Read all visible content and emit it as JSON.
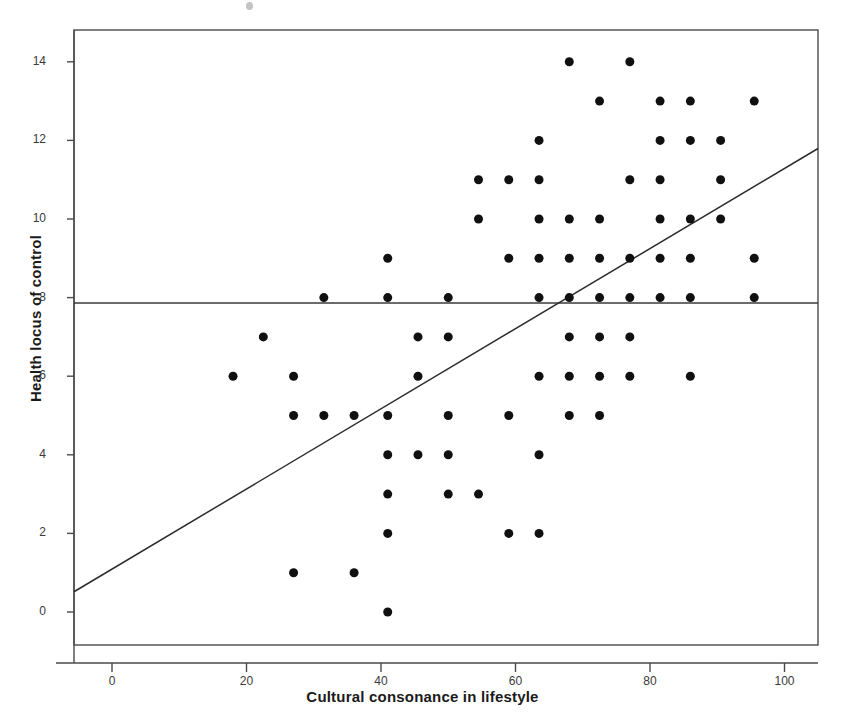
{
  "chart_data": {
    "type": "scatter",
    "title": "",
    "xlabel": "Cultural consonance in lifestyle",
    "ylabel": "Health locus of control",
    "xlim": [
      -6,
      107
    ],
    "ylim": [
      -1.2,
      14.9
    ],
    "xticks": [
      0,
      20,
      40,
      60,
      80,
      100
    ],
    "yticks": [
      0,
      2,
      4,
      6,
      8,
      10,
      12,
      14
    ],
    "xtick_labels": [
      "0",
      "20",
      "40",
      "60",
      "80",
      "100"
    ],
    "ytick_labels": [
      "0",
      "2",
      "4",
      "6",
      "8",
      "10",
      "12",
      "14"
    ],
    "grid": false,
    "legend": null,
    "marker": "filled-circle",
    "marker_color": "#101010",
    "marker_size": 9,
    "points": [
      [
        18,
        6
      ],
      [
        22.5,
        7
      ],
      [
        27,
        6
      ],
      [
        27,
        5
      ],
      [
        27,
        1
      ],
      [
        31.5,
        8
      ],
      [
        31.5,
        5
      ],
      [
        36,
        5
      ],
      [
        36,
        1
      ],
      [
        41,
        9
      ],
      [
        41,
        8
      ],
      [
        41,
        5
      ],
      [
        41,
        4
      ],
      [
        41,
        3
      ],
      [
        41,
        2
      ],
      [
        41,
        0
      ],
      [
        45.5,
        7
      ],
      [
        45.5,
        6
      ],
      [
        45.5,
        4
      ],
      [
        50,
        8
      ],
      [
        50,
        7
      ],
      [
        50,
        5
      ],
      [
        50,
        4
      ],
      [
        50,
        3
      ],
      [
        54.5,
        11
      ],
      [
        54.5,
        10
      ],
      [
        54.5,
        3
      ],
      [
        59,
        11
      ],
      [
        59,
        9
      ],
      [
        59,
        5
      ],
      [
        59,
        2
      ],
      [
        63.5,
        12
      ],
      [
        63.5,
        11
      ],
      [
        63.5,
        10
      ],
      [
        63.5,
        9
      ],
      [
        63.5,
        8
      ],
      [
        63.5,
        6
      ],
      [
        63.5,
        4
      ],
      [
        63.5,
        2
      ],
      [
        68,
        14
      ],
      [
        68,
        10
      ],
      [
        68,
        9
      ],
      [
        68,
        8
      ],
      [
        68,
        7
      ],
      [
        68,
        6
      ],
      [
        68,
        5
      ],
      [
        72.5,
        13
      ],
      [
        72.5,
        10
      ],
      [
        72.5,
        9
      ],
      [
        72.5,
        8
      ],
      [
        72.5,
        7
      ],
      [
        72.5,
        6
      ],
      [
        72.5,
        5
      ],
      [
        77,
        14
      ],
      [
        77,
        11
      ],
      [
        77,
        9
      ],
      [
        77,
        8
      ],
      [
        77,
        7
      ],
      [
        77,
        6
      ],
      [
        81.5,
        13
      ],
      [
        81.5,
        12
      ],
      [
        81.5,
        11
      ],
      [
        81.5,
        10
      ],
      [
        81.5,
        9
      ],
      [
        81.5,
        8
      ],
      [
        86,
        13
      ],
      [
        86,
        12
      ],
      [
        86,
        10
      ],
      [
        86,
        9
      ],
      [
        86,
        8
      ],
      [
        86,
        6
      ],
      [
        90.5,
        12
      ],
      [
        90.5,
        11
      ],
      [
        90.5,
        10
      ],
      [
        95.5,
        13
      ],
      [
        95.5,
        9
      ],
      [
        95.5,
        8
      ]
    ],
    "regression_line": {
      "label": "fit-line",
      "x_start": -6,
      "y_start": 0.48,
      "x_end": 107,
      "y_end": 12.0,
      "color": "#2b2b2b"
    },
    "reference_line": {
      "label": "horizontal-mean-line",
      "orientation": "horizontal",
      "y": 7.86,
      "color": "#3a3a3a"
    }
  }
}
